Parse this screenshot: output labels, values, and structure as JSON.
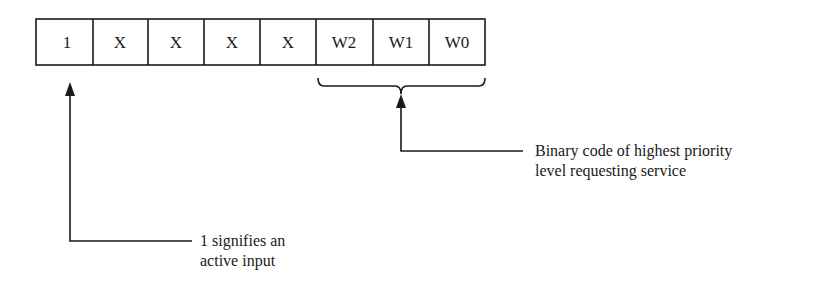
{
  "register": {
    "cells": [
      "1",
      "X",
      "X",
      "X",
      "X",
      "W2",
      "W1",
      "W0"
    ]
  },
  "annotations": {
    "active_input": {
      "line1": "1 signifies an",
      "line2": "active input"
    },
    "priority_code": {
      "line1": "Binary code of highest priority",
      "line2": "level requesting service"
    }
  },
  "colors": {
    "stroke": "#1a1a1a",
    "background": "#ffffff"
  }
}
